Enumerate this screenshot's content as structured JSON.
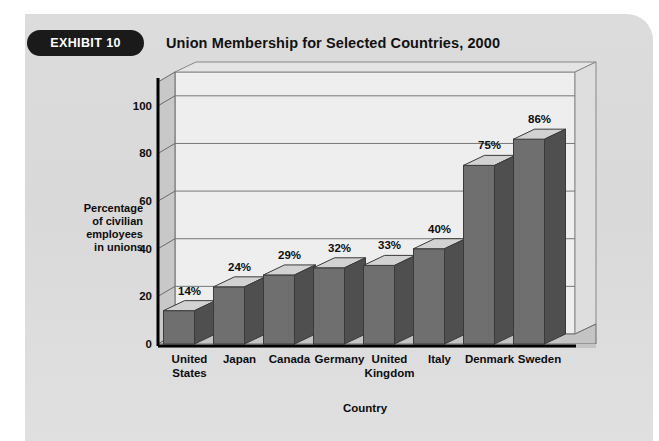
{
  "exhibit": {
    "badge_label": "EXHIBIT 10",
    "title": "Union Membership for Selected Countries, 2000"
  },
  "colors": {
    "panel_background": "#dcdcdc",
    "badge_background": "#1a1a1a",
    "badge_text": "#ffffff",
    "title_text": "#111111",
    "plot_background": "#eeeeee",
    "left_wall": "#c8c8c8",
    "floor": "#c4c4c4",
    "bar_front": "#6f6f6f",
    "bar_top": "#d2d2d2",
    "bar_side": "#4f4f4f",
    "gridline": "#777777",
    "axis_line": "#000000"
  },
  "axis_label_lines": [
    "Percentage",
    "of civilian",
    "employees",
    "in unions"
  ],
  "chart_data": {
    "type": "bar",
    "title": "Union Membership for Selected Countries, 2000",
    "xlabel": "Country",
    "ylabel": "Percentage of civilian employees in unions",
    "ylim": [
      0,
      110
    ],
    "yticks": [
      0,
      20,
      40,
      60,
      80,
      100
    ],
    "grid": true,
    "legend": "none",
    "value_suffix": "%",
    "categories": [
      "United States",
      "Japan",
      "Canada",
      "Germany",
      "United Kingdom",
      "Italy",
      "Denmark",
      "Sweden"
    ],
    "category_lines": [
      [
        "United",
        "States"
      ],
      [
        "Japan"
      ],
      [
        "Canada"
      ],
      [
        "Germany"
      ],
      [
        "United",
        "Kingdom"
      ],
      [
        "Italy"
      ],
      [
        "Denmark"
      ],
      [
        "Sweden"
      ]
    ],
    "values": [
      14,
      24,
      29,
      32,
      33,
      40,
      75,
      86
    ],
    "data_labels": [
      "14%",
      "24%",
      "29%",
      "32%",
      "33%",
      "40%",
      "75%",
      "86%"
    ]
  }
}
